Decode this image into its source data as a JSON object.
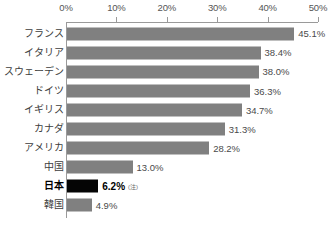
{
  "chart_data": {
    "type": "bar",
    "orientation": "horizontal",
    "title": "",
    "subtitle": "",
    "xlabel": "",
    "ylabel": "",
    "xlim": [
      0,
      50
    ],
    "xticks": [
      0,
      10,
      20,
      30,
      40,
      50
    ],
    "xtick_labels": [
      "0%",
      "10%",
      "20%",
      "30%",
      "40%",
      "50%"
    ],
    "grid": false,
    "legend": false,
    "categories": [
      "フランス",
      "イタリア",
      "スウェーデン",
      "ドイツ",
      "イギリス",
      "カナダ",
      "アメリカ",
      "中国",
      "日本",
      "韓国"
    ],
    "values": [
      45.1,
      38.4,
      38.0,
      36.3,
      34.7,
      31.3,
      28.2,
      13.0,
      6.2,
      4.9
    ],
    "value_labels": [
      "45.1%",
      "38.4%",
      "38.0%",
      "36.3%",
      "34.7%",
      "31.3%",
      "28.2%",
      "13.0%",
      "6.2%",
      "4.9%"
    ],
    "highlight_index": 8,
    "annotations": [
      {
        "index": 8,
        "text": "(注)"
      }
    ],
    "colors": {
      "bar": "#808080",
      "bar_highlight": "#050505",
      "axis": "#9a9a9a",
      "text": "#3d3d3d",
      "background": "#ffffff"
    }
  }
}
